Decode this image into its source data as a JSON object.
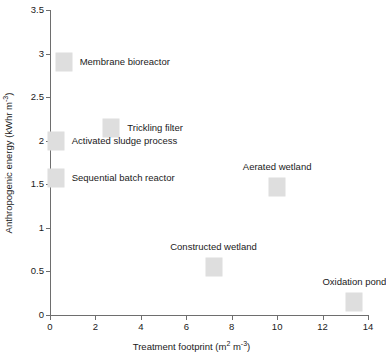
{
  "chart_data": {
    "type": "scatter",
    "title": "",
    "xlabel": "Treatment footprint (m2 m-3)",
    "ylabel": "Anthropogenic  energy (kWhr m-3)",
    "xlabel_parts": {
      "base": "Treatment footprint (m",
      "sup1": "2",
      "mid": " m",
      "sup2": "-3",
      "end": ")"
    },
    "ylabel_parts": {
      "base": "Anthropogenic  energy (kWhr m",
      "sup1": "-3",
      "end": ")"
    },
    "xlim": [
      0,
      14
    ],
    "ylim": [
      0,
      3.5
    ],
    "xticks": [
      "0",
      "2",
      "4",
      "6",
      "8",
      "10",
      "12",
      "14"
    ],
    "xtick_values": [
      0,
      2,
      4,
      6,
      8,
      10,
      12,
      14
    ],
    "yticks": [
      "0",
      "0.5",
      "1",
      "1.5",
      "2",
      "2.5",
      "3",
      "3.5"
    ],
    "ytick_values": [
      0,
      0.5,
      1,
      1.5,
      2,
      2.5,
      3,
      3.5
    ],
    "grid": false,
    "legend": "none",
    "marker_color": "#dedede",
    "axis_color": "#6e6e6e",
    "text_color": "#1a1a1a",
    "points": [
      {
        "label": "Membrane bioreactor",
        "x": 0.6,
        "y": 2.9,
        "label_position": "right"
      },
      {
        "label": "Trickling filter",
        "x": 2.7,
        "y": 2.15,
        "label_position": "right"
      },
      {
        "label": "Activated sludge process",
        "x": 0.25,
        "y": 2.0,
        "label_position": "right"
      },
      {
        "label": "Sequential batch reactor",
        "x": 0.25,
        "y": 1.57,
        "label_position": "right"
      },
      {
        "label": "Aerated wetland",
        "x": 10.0,
        "y": 1.47,
        "label_position": "above"
      },
      {
        "label": "Constructed wetland",
        "x": 7.2,
        "y": 0.55,
        "label_position": "above"
      },
      {
        "label": "Oxidation pond",
        "x": 13.4,
        "y": 0.15,
        "label_position": "above"
      }
    ]
  }
}
